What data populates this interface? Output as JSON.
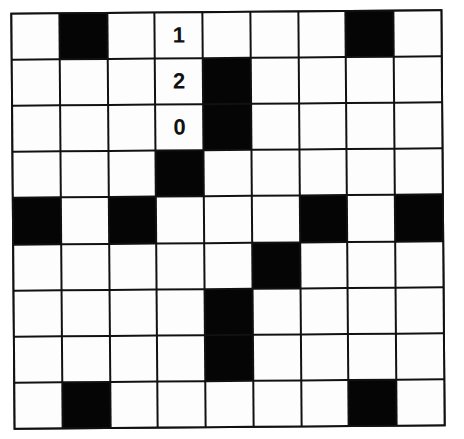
{
  "puzzle": {
    "rows": 9,
    "cols": 9,
    "colors": {
      "black": "#050505",
      "white": "#fdfdfd",
      "line": "#111111"
    },
    "grid": [
      [
        "",
        "#",
        "",
        "1",
        "",
        "",
        "",
        "#",
        ""
      ],
      [
        "",
        "",
        "",
        "2",
        "#",
        "",
        "",
        "",
        ""
      ],
      [
        "",
        "",
        "",
        "0",
        "#",
        "",
        "",
        "",
        ""
      ],
      [
        "",
        "",
        "",
        "#",
        "",
        "",
        "",
        "",
        ""
      ],
      [
        "#",
        "",
        "#",
        "",
        "",
        "",
        "#",
        "",
        "#"
      ],
      [
        "",
        "",
        "",
        "",
        "",
        "#",
        "",
        "",
        ""
      ],
      [
        "",
        "",
        "",
        "",
        "#",
        "",
        "",
        "",
        ""
      ],
      [
        "",
        "",
        "",
        "",
        "#",
        "",
        "",
        "",
        ""
      ],
      [
        "",
        "#",
        "",
        "",
        "",
        "",
        "",
        "#",
        ""
      ]
    ]
  }
}
